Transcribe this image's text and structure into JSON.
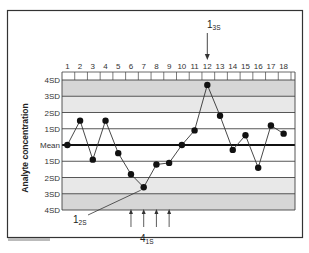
{
  "chart_data": {
    "type": "line",
    "title": "",
    "xlabel": "",
    "ylabel": "Analyte concentration",
    "x": [
      1,
      2,
      3,
      4,
      5,
      6,
      7,
      8,
      9,
      10,
      11,
      12,
      13,
      14,
      15,
      16,
      17,
      18
    ],
    "series": [
      {
        "name": "Control values (SD units from mean)",
        "values": [
          0,
          1.5,
          -0.9,
          1.5,
          -0.5,
          -1.8,
          -2.6,
          -1.2,
          -1.1,
          0,
          0.9,
          3.7,
          1.8,
          -0.3,
          0.6,
          -1.4,
          1.2,
          0.7
        ]
      }
    ],
    "ylim": [
      -4,
      4
    ],
    "y_tick_labels": [
      "4SD",
      "3SD",
      "2SD",
      "1SD",
      "Mean",
      "1SD",
      "2SD",
      "3SD",
      "4SD"
    ],
    "y_tick_values": [
      4,
      3,
      2,
      1,
      0,
      -1,
      -2,
      -3,
      -4
    ],
    "grid": true,
    "bands": [
      {
        "from": 3,
        "to": 4,
        "color": "#d6d6d6"
      },
      {
        "from": 2,
        "to": 3,
        "color": "#e8e8e8"
      },
      {
        "from": -2,
        "to": 2,
        "color": "#ffffff"
      },
      {
        "from": -3,
        "to": -2,
        "color": "#e8e8e8"
      },
      {
        "from": -4,
        "to": -3,
        "color": "#d6d6d6"
      }
    ],
    "annotations": [
      {
        "label": "1",
        "sub": "3S",
        "target_run": 12,
        "type": "arrow-down"
      },
      {
        "label": "1",
        "sub": "2S",
        "target_run": 7,
        "type": "pointer-line"
      },
      {
        "label": "4",
        "sub": "1S",
        "target_runs": [
          6,
          7,
          8,
          9
        ],
        "type": "arrows-up"
      }
    ]
  },
  "labels": {
    "ylabel": "Analyte concentration",
    "rule_13s_main": "1",
    "rule_13s_sub": "3S",
    "rule_12s_main": "1",
    "rule_12s_sub": "2S",
    "rule_41s_main": "4",
    "rule_41s_sub": "1S"
  },
  "colors": {
    "line": "#333333",
    "point": "#111111",
    "mean_line": "#111111",
    "grid": "#444444",
    "frame": "#333333"
  }
}
